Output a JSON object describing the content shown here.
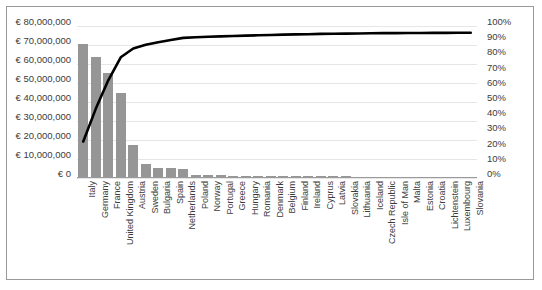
{
  "chart_title": "",
  "axes": {
    "left_ticks": [
      "€ 80,000,000",
      "€ 70,000,000",
      "€ 60,000,000",
      "€ 50,000,000",
      "€ 40,000,000",
      "€ 30,000,000",
      "€ 20,000,000",
      "€ 10,000,000",
      "€ 0"
    ],
    "right_ticks": [
      "100%",
      "90%",
      "80%",
      "70%",
      "60%",
      "50%",
      "40%",
      "30%",
      "20%",
      "10%",
      "0%"
    ]
  },
  "colors": {
    "bar": "#969696",
    "line": "#000000",
    "grid": "#e6e6e6",
    "frame": "#9a9a9a",
    "text": "#3c3c3c"
  },
  "chart_data": {
    "type": "bar",
    "title": "",
    "xlabel": "",
    "ylabel": "",
    "ylim": [
      0,
      80000000
    ],
    "y2lim": [
      0,
      100
    ],
    "grid": true,
    "legend": "none",
    "categories": [
      "Italy",
      "Germany",
      "France",
      "United Kingdom",
      "Austria",
      "Sweden",
      "Bulgaria",
      "Spain",
      "Netherlands",
      "Poland",
      "Norway",
      "Portugal",
      "Greece",
      "Hungary",
      "Romania",
      "Denmark",
      "Belgium",
      "Finland",
      "Ireland",
      "Cyprus",
      "Latvia",
      "Slovakia",
      "Lithuania",
      "Iceland",
      "Czech Republic",
      "Isle of Man",
      "Malta",
      "Estonia",
      "Croatia",
      "Lichtenstein",
      "Luxembourg",
      "Slovania"
    ],
    "series": [
      {
        "name": "Amount",
        "axis": "left",
        "type": "bar",
        "values": [
          70000000,
          63000000,
          55000000,
          44000000,
          17000000,
          7000000,
          5000000,
          4500000,
          4000000,
          1200000,
          900000,
          800000,
          700000,
          650000,
          600000,
          550000,
          500000,
          450000,
          400000,
          350000,
          300000,
          280000,
          250000,
          220000,
          200000,
          180000,
          160000,
          140000,
          120000,
          100000,
          80000,
          60000
        ]
      },
      {
        "name": "Cumulative %",
        "axis": "right",
        "type": "line",
        "values": [
          24.0,
          45.5,
          64.3,
          79.4,
          85.2,
          87.6,
          89.3,
          90.8,
          92.2,
          92.6,
          92.9,
          93.2,
          93.4,
          93.7,
          93.9,
          94.1,
          94.3,
          94.5,
          94.6,
          94.8,
          94.9,
          95.0,
          95.1,
          95.2,
          95.3,
          95.3,
          95.4,
          95.4,
          95.5,
          95.5,
          95.6,
          95.6
        ]
      }
    ]
  }
}
